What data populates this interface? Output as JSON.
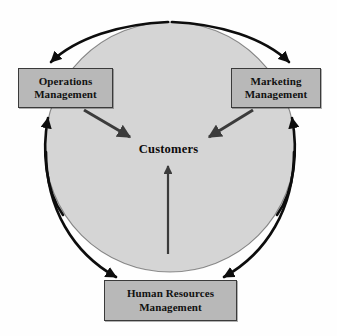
{
  "diagram": {
    "title": "Customers",
    "type": "cycle-diagram",
    "center_label": "Customers",
    "circle": {
      "fill_color": "#d5d5d5",
      "stroke_color": "#111111",
      "center_x": 170,
      "center_y": 147,
      "radius": 125
    },
    "box_style": {
      "fill_color": "#b8b8b8",
      "border_color": "#3a3a3a",
      "text_color": "#111111"
    },
    "arrow_color": "#3b3b3b",
    "arc_color": "#0d0d0d",
    "nodes": [
      {
        "id": "operations",
        "line1": "Operations",
        "line2": "Management"
      },
      {
        "id": "marketing",
        "line1": "Marketing",
        "line2": "Management"
      },
      {
        "id": "human-resources",
        "line1": "Human Resources",
        "line2": "Management"
      }
    ],
    "connections": [
      {
        "from": "operations",
        "to": "customers",
        "style": "straight-arrow"
      },
      {
        "from": "marketing",
        "to": "customers",
        "style": "straight-arrow"
      },
      {
        "from": "human-resources",
        "to": "customers",
        "style": "straight-arrow"
      },
      {
        "from": "cycle-top",
        "to": "operations",
        "style": "curved-arrow"
      },
      {
        "from": "cycle-top",
        "to": "marketing",
        "style": "curved-arrow"
      },
      {
        "from": "cycle-left",
        "to": "operations",
        "style": "curved-arrow"
      },
      {
        "from": "cycle-right",
        "to": "marketing",
        "style": "curved-arrow"
      },
      {
        "from": "cycle-bottom-left",
        "to": "human-resources",
        "style": "curved-arrow"
      },
      {
        "from": "cycle-bottom-right",
        "to": "human-resources",
        "style": "curved-arrow"
      }
    ]
  }
}
